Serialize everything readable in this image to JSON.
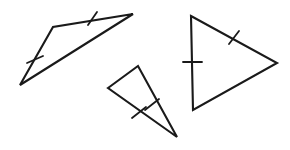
{
  "figure": {
    "canvas": {
      "width": 290,
      "height": 150
    },
    "background_color": "#ffffff",
    "stroke_color": "#1a1a1a",
    "shapes": [
      {
        "name": "left-triangle",
        "label": "Left triangle",
        "vertices": [
          [
            20,
            85
          ],
          [
            53,
            27
          ],
          [
            133,
            14
          ]
        ],
        "points_attr": "20,85 53,27 133,14",
        "stroke_width": 2.1,
        "tick_marks": [
          {
            "name": "left-triangle-tick-top",
            "label": "Single tick on top edge",
            "x1": 88,
            "y1": 25,
            "x2": 97,
            "y2": 12,
            "stroke_width": 1.8
          },
          {
            "name": "left-triangle-tick-left",
            "label": "Single tick on left edge",
            "x1": 27,
            "y1": 63,
            "x2": 43,
            "y2": 56,
            "stroke_width": 1.8
          }
        ]
      },
      {
        "name": "middle-triangle",
        "label": "Middle triangle",
        "vertices": [
          [
            108,
            88
          ],
          [
            138,
            66
          ],
          [
            177,
            137
          ]
        ],
        "points_attr": "108,88 138,66 177,137",
        "stroke_width": 2.1,
        "tick_marks": [
          {
            "name": "middle-triangle-tick-right",
            "label": "Single tick on right edge",
            "x1": 145,
            "y1": 110,
            "x2": 159,
            "y2": 99,
            "stroke_width": 1.8
          },
          {
            "name": "middle-triangle-tick-bottom",
            "label": "Single tick on bottom-left edge",
            "x1": 132,
            "y1": 118,
            "x2": 146,
            "y2": 107,
            "stroke_width": 1.8
          }
        ]
      },
      {
        "name": "right-triangle",
        "label": "Right triangle",
        "vertices": [
          [
            191,
            16
          ],
          [
            277,
            63
          ],
          [
            193,
            110
          ]
        ],
        "points_attr": "191,16 277,63 193,110",
        "stroke_width": 2.1,
        "tick_marks": [
          {
            "name": "right-triangle-tick-left",
            "label": "Single tick on vertical left edge",
            "x1": 183,
            "y1": 62,
            "x2": 202,
            "y2": 62,
            "stroke_width": 1.8
          },
          {
            "name": "right-triangle-tick-upper",
            "label": "Single tick on upper-right edge",
            "x1": 229,
            "y1": 44,
            "x2": 239,
            "y2": 31,
            "stroke_width": 1.8
          }
        ]
      }
    ]
  }
}
